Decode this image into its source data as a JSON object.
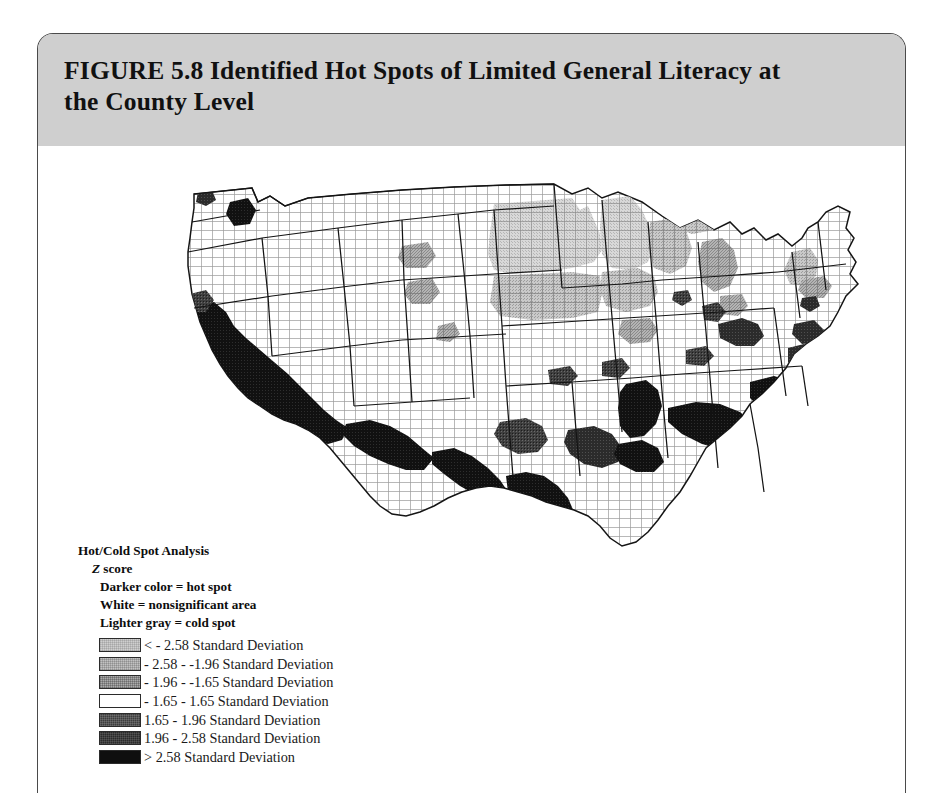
{
  "figure": {
    "label": "FIGURE",
    "number": "5.8",
    "title": "Identified Hot Spots of Limited General Literacy at the County Level",
    "title_line1": "FIGURE 5.8  Identified Hot Spots of Limited General Literacy at",
    "title_line2": "the County Level"
  },
  "legend": {
    "heading": "Hot/Cold Spot Analysis",
    "subheading_italic": "Z",
    "subheading_rest": " score",
    "subheading": "Z score",
    "notes": [
      "Darker color = hot spot",
      "White = nonsignificant area",
      "Lighter  gray = cold spot"
    ],
    "classes": [
      {
        "label": "< - 2.58 Standard Deviation",
        "color": "#cccccc",
        "kind": "cold"
      },
      {
        "label": "- 2.58 - -1.96 Standard Deviation",
        "color": "#bcbcbc",
        "kind": "cold"
      },
      {
        "label": "- 1.96 - -1.65 Standard Deviation",
        "color": "#a8a8a8",
        "kind": "cold"
      },
      {
        "label": "- 1.65 - 1.65 Standard Deviation",
        "color": "#ffffff",
        "kind": "neutral"
      },
      {
        "label": "1.65 - 1.96 Standard Deviation",
        "color": "#3c3c3c",
        "kind": "hot"
      },
      {
        "label": "1.96 - 2.58 Standard Deviation",
        "color": "#2a2a2a",
        "kind": "hot"
      },
      {
        "label": "> 2.58 Standard Deviation",
        "color": "#0d0d0d",
        "kind": "hot"
      }
    ]
  },
  "map": {
    "kind": "choropleth",
    "geography": "United States counties (contiguous 48 states)",
    "variable": "Limited general literacy hot/cold spot z score",
    "palette": {
      "cold_strong": "#cccccc",
      "cold_mid": "#bcbcbc",
      "cold_weak": "#a8a8a8",
      "neutral": "#ffffff",
      "hot_weak": "#3c3c3c",
      "hot_mid": "#2a2a2a",
      "hot_strong": "#0d0d0d",
      "county_line": "#8a8a8a",
      "state_line": "#1a1a1a"
    },
    "regions": [
      {
        "name": "Southern California / Imperial Valley",
        "class": "hot_strong"
      },
      {
        "name": "US-Mexico border, Arizona to South Texas",
        "class": "hot_strong"
      },
      {
        "name": "Rio Grande Valley, Texas",
        "class": "hot_strong"
      },
      {
        "name": "Mississippi Delta",
        "class": "hot_strong"
      },
      {
        "name": "Alabama / Georgia Black Belt",
        "class": "hot_strong"
      },
      {
        "name": "Coastal South Carolina and North Carolina",
        "class": "hot_strong"
      },
      {
        "name": "South Florida",
        "class": "hot_strong"
      },
      {
        "name": "Central Appalachia / Kentucky",
        "class": "hot_mid"
      },
      {
        "name": "Central Valley, California",
        "class": "hot_mid"
      },
      {
        "name": "Yakima Valley, Washington",
        "class": "hot_strong"
      },
      {
        "name": "North Dakota and South Dakota",
        "class": "cold_strong"
      },
      {
        "name": "Minnesota and Wisconsin",
        "class": "cold_strong"
      },
      {
        "name": "Nebraska and Kansas plains",
        "class": "cold_mid"
      },
      {
        "name": "Iowa",
        "class": "cold_mid"
      },
      {
        "name": "Michigan",
        "class": "cold_mid"
      },
      {
        "name": "Vermont / New Hampshire / Massachusetts",
        "class": "cold_mid"
      },
      {
        "name": "Mountain West (Montana, Wyoming, Idaho, Utah, Nevada)",
        "class": "neutral"
      }
    ]
  }
}
